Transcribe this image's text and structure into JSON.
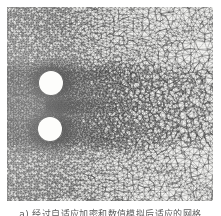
{
  "figure": {
    "kind": "adaptive-unstructured-mesh-plot",
    "caption": "a) 经过自适应加密和数值模拟后适应的网格",
    "caption_note": "caption is clipped at the bottom edge of the scan",
    "colors": {
      "background": "#ffffff",
      "mesh_line": "#4a4a4a",
      "mesh_fill_light": "#f2f2f0",
      "mesh_fill_dark": "#6e6e6e",
      "cylinder_fill": "#fdfdfb",
      "caption_text": "#5d5d5d"
    },
    "plot_area": {
      "x": 7,
      "y": 7,
      "width": 206,
      "height": 194
    },
    "objects": [
      {
        "name": "cylinder-upper",
        "label": "upper circular cylinder",
        "center_x": 44,
        "center_y": 76,
        "diameter": 24
      },
      {
        "name": "cylinder-lower",
        "label": "lower circular cylinder",
        "center_x": 43,
        "center_y": 122,
        "diameter": 24
      }
    ],
    "refinement_zones": [
      {
        "name": "near-wake-core",
        "label": "densest refinement downstream of cylinders",
        "density": "very-fine"
      },
      {
        "name": "cylinder-boundary-layer",
        "label": "boundary layer refinement on cylinder surfaces",
        "density": "very-fine"
      },
      {
        "name": "shear-layer-upper",
        "label": "upper shear layer / wake envelope",
        "density": "fine"
      },
      {
        "name": "shear-layer-lower",
        "label": "lower shear layer / wake envelope",
        "density": "fine"
      },
      {
        "name": "upstream-field",
        "label": "upstream uniform field",
        "density": "medium"
      },
      {
        "name": "far-field-upper-right",
        "label": "coarse far field",
        "density": "coarse"
      },
      {
        "name": "far-field-lower-right",
        "label": "coarse far field",
        "density": "coarse"
      }
    ]
  },
  "chart_data": {
    "type": "mesh",
    "title": "a) 经过自适应加密和数值模拟后适应的网格",
    "xlabel": "",
    "ylabel": "",
    "grid": false,
    "legend": "none",
    "domain_extent": {
      "x": [
        0,
        206
      ],
      "y": [
        0,
        194
      ]
    },
    "cylinders": [
      {
        "name": "upper",
        "cx": 44,
        "cy": 76,
        "r": 12
      },
      {
        "name": "lower",
        "cx": 43,
        "cy": 122,
        "r": 12
      }
    ],
    "density_map": {
      "scale": "relative cell size, 1 = finest",
      "zones": [
        {
          "zone": "wake-core",
          "x": [
            55,
            130
          ],
          "y": [
            60,
            145
          ],
          "relative_cell_size": 1
        },
        {
          "zone": "cylinder-surface",
          "x": [
            30,
            60
          ],
          "y": [
            60,
            140
          ],
          "relative_cell_size": 1
        },
        {
          "zone": "wake-envelope",
          "x": [
            55,
            175
          ],
          "y": [
            35,
            175
          ],
          "relative_cell_size": 2
        },
        {
          "zone": "upstream",
          "x": [
            0,
            35
          ],
          "y": [
            0,
            194
          ],
          "relative_cell_size": 4
        },
        {
          "zone": "far-field",
          "x": [
            150,
            206
          ],
          "y": [
            0,
            60
          ],
          "relative_cell_size": 8
        },
        {
          "zone": "far-field-low",
          "x": [
            150,
            206
          ],
          "y": [
            150,
            194
          ],
          "relative_cell_size": 8
        }
      ]
    }
  }
}
